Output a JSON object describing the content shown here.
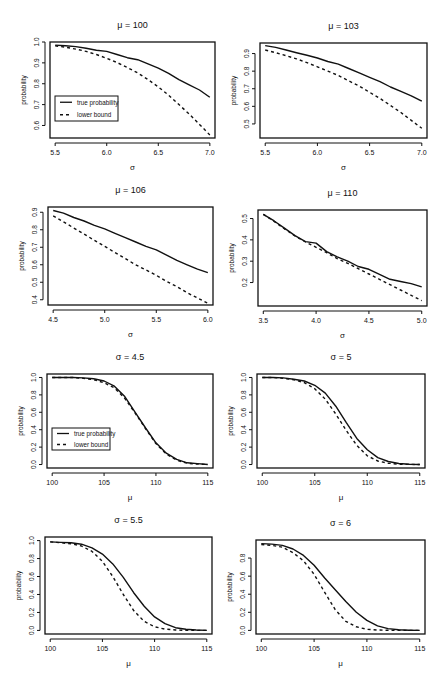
{
  "chart_data": [
    {
      "type": "line",
      "title": "μ = 100",
      "xlabel": "σ",
      "ylabel": "probability",
      "box": [
        50,
        42,
        215,
        138
      ],
      "xlim": [
        5.45,
        7.05
      ],
      "ylim": [
        0.54,
        1.0
      ],
      "xticks": [
        5.5,
        6.0,
        6.5,
        7.0
      ],
      "xtick_labels": [
        "5.5",
        "6.0",
        "6.5",
        "7.0"
      ],
      "yticks": [
        0.6,
        0.7,
        0.8,
        0.9,
        1.0
      ],
      "ytick_labels": [
        "0.6",
        "0.7",
        "0.8",
        "0.9",
        "1.0"
      ],
      "legend": {
        "entries": [
          "true probability",
          "lower bound"
        ],
        "box": [
          55,
          96,
          118,
          121
        ]
      },
      "series": [
        {
          "name": "true probability",
          "style": "solid",
          "x": [
            5.5,
            5.6,
            5.7,
            5.8,
            5.9,
            6.0,
            6.1,
            6.2,
            6.3,
            6.4,
            6.5,
            6.6,
            6.7,
            6.8,
            6.9,
            7.0
          ],
          "y": [
            0.985,
            0.982,
            0.978,
            0.97,
            0.96,
            0.955,
            0.94,
            0.925,
            0.915,
            0.895,
            0.875,
            0.85,
            0.82,
            0.795,
            0.77,
            0.735
          ]
        },
        {
          "name": "lower bound",
          "style": "dashed",
          "x": [
            5.5,
            5.6,
            5.7,
            5.8,
            5.9,
            6.0,
            6.1,
            6.2,
            6.3,
            6.4,
            6.5,
            6.6,
            6.7,
            6.8,
            6.9,
            7.0
          ],
          "y": [
            0.982,
            0.975,
            0.966,
            0.955,
            0.94,
            0.922,
            0.902,
            0.878,
            0.852,
            0.82,
            0.785,
            0.745,
            0.7,
            0.655,
            0.605,
            0.555
          ]
        }
      ]
    },
    {
      "type": "line",
      "title": "μ = 103",
      "xlabel": "σ",
      "ylabel": "probability",
      "box": [
        260,
        43,
        427,
        138
      ],
      "xlim": [
        5.45,
        7.05
      ],
      "ylim": [
        0.42,
        0.96
      ],
      "xticks": [
        5.5,
        6.0,
        6.5,
        7.0
      ],
      "xtick_labels": [
        "5.5",
        "6.0",
        "6.5",
        "7.0"
      ],
      "yticks": [
        0.5,
        0.6,
        0.7,
        0.8,
        0.9
      ],
      "ytick_labels": [
        "0.5",
        "0.6",
        "0.7",
        "0.8",
        "0.9"
      ],
      "series": [
        {
          "name": "true probability",
          "style": "solid",
          "x": [
            5.5,
            5.6,
            5.7,
            5.8,
            5.9,
            6.0,
            6.1,
            6.2,
            6.3,
            6.4,
            6.5,
            6.6,
            6.7,
            6.8,
            6.9,
            7.0
          ],
          "y": [
            0.945,
            0.935,
            0.92,
            0.905,
            0.89,
            0.875,
            0.855,
            0.84,
            0.815,
            0.79,
            0.765,
            0.74,
            0.71,
            0.685,
            0.66,
            0.63
          ]
        },
        {
          "name": "lower bound",
          "style": "dashed",
          "x": [
            5.5,
            5.6,
            5.7,
            5.8,
            5.9,
            6.0,
            6.1,
            6.2,
            6.3,
            6.4,
            6.5,
            6.6,
            6.7,
            6.8,
            6.9,
            7.0
          ],
          "y": [
            0.92,
            0.905,
            0.888,
            0.87,
            0.848,
            0.825,
            0.8,
            0.775,
            0.745,
            0.715,
            0.68,
            0.645,
            0.605,
            0.565,
            0.52,
            0.475
          ]
        }
      ]
    },
    {
      "type": "line",
      "title": "μ = 106",
      "xlabel": "σ",
      "ylabel": "probability",
      "box": [
        48,
        207,
        213,
        305
      ],
      "xlim": [
        4.45,
        6.05
      ],
      "ylim": [
        0.37,
        0.93
      ],
      "xticks": [
        4.5,
        5.0,
        5.5,
        6.0
      ],
      "xtick_labels": [
        "4.5",
        "5.0",
        "5.5",
        "6.0"
      ],
      "yticks": [
        0.4,
        0.5,
        0.6,
        0.7,
        0.8,
        0.9
      ],
      "ytick_labels": [
        "0.4",
        "0.5",
        "0.6",
        "0.7",
        "0.8",
        "0.9"
      ],
      "series": [
        {
          "name": "true probability",
          "style": "solid",
          "x": [
            4.5,
            4.6,
            4.7,
            4.8,
            4.9,
            5.0,
            5.1,
            5.2,
            5.3,
            5.4,
            5.5,
            5.6,
            5.7,
            5.8,
            5.9,
            6.0
          ],
          "y": [
            0.91,
            0.895,
            0.87,
            0.85,
            0.825,
            0.805,
            0.78,
            0.755,
            0.73,
            0.705,
            0.685,
            0.655,
            0.625,
            0.6,
            0.575,
            0.555
          ]
        },
        {
          "name": "lower bound",
          "style": "dashed",
          "x": [
            4.5,
            4.6,
            4.7,
            4.8,
            4.9,
            5.0,
            5.1,
            5.2,
            5.3,
            5.4,
            5.5,
            5.6,
            5.7,
            5.8,
            5.9,
            6.0
          ],
          "y": [
            0.88,
            0.845,
            0.81,
            0.775,
            0.74,
            0.705,
            0.67,
            0.635,
            0.6,
            0.57,
            0.54,
            0.505,
            0.475,
            0.44,
            0.41,
            0.38
          ]
        }
      ]
    },
    {
      "type": "line",
      "title": "μ = 110",
      "xlabel": "σ",
      "ylabel": "probability",
      "box": [
        258,
        210,
        427,
        306
      ],
      "xlim": [
        3.45,
        5.05
      ],
      "ylim": [
        0.09,
        0.54
      ],
      "xticks": [
        3.5,
        4.0,
        4.5,
        5.0
      ],
      "xtick_labels": [
        "3.5",
        "4.0",
        "4.5",
        "5.0"
      ],
      "yticks": [
        0.2,
        0.3,
        0.4,
        0.5
      ],
      "ytick_labels": [
        "0.2",
        "0.3",
        "0.4",
        "0.5"
      ],
      "series": [
        {
          "name": "true probability",
          "style": "solid",
          "x": [
            3.5,
            3.6,
            3.7,
            3.8,
            3.9,
            4.0,
            4.1,
            4.2,
            4.3,
            4.4,
            4.5,
            4.6,
            4.7,
            4.8,
            4.9,
            5.0
          ],
          "y": [
            0.52,
            0.49,
            0.455,
            0.42,
            0.392,
            0.385,
            0.345,
            0.32,
            0.3,
            0.275,
            0.262,
            0.238,
            0.215,
            0.205,
            0.195,
            0.18
          ]
        },
        {
          "name": "lower bound",
          "style": "dashed",
          "x": [
            3.5,
            3.6,
            3.7,
            3.8,
            3.9,
            4.0,
            4.1,
            4.2,
            4.3,
            4.4,
            4.5,
            4.6,
            4.7,
            4.8,
            4.9,
            5.0
          ],
          "y": [
            0.52,
            0.488,
            0.452,
            0.418,
            0.39,
            0.365,
            0.34,
            0.312,
            0.29,
            0.265,
            0.24,
            0.215,
            0.19,
            0.165,
            0.14,
            0.115
          ]
        }
      ]
    },
    {
      "type": "line",
      "title": "σ = 4.5",
      "xlabel": "μ",
      "ylabel": "probability",
      "box": [
        47,
        374,
        213,
        468
      ],
      "xlim": [
        99.5,
        115.5
      ],
      "ylim": [
        -0.04,
        1.04
      ],
      "xticks": [
        100,
        105,
        110,
        115
      ],
      "xtick_labels": [
        "100",
        "105",
        "110",
        "115"
      ],
      "yticks": [
        0.0,
        0.2,
        0.4,
        0.6,
        0.8,
        1.0
      ],
      "ytick_labels": [
        "0.0",
        "0.2",
        "0.4",
        "0.6",
        "0.8",
        "1.0"
      ],
      "legend": {
        "entries": [
          "true probability",
          "lower bound"
        ],
        "box": [
          52,
          428,
          110,
          450
        ]
      },
      "series": [
        {
          "name": "true probability",
          "style": "solid",
          "x": [
            100,
            101,
            102,
            103,
            104,
            105,
            106,
            107,
            108,
            109,
            110,
            111,
            112,
            113,
            114,
            115
          ],
          "y": [
            1.0,
            1.0,
            1.0,
            0.995,
            0.985,
            0.96,
            0.9,
            0.78,
            0.6,
            0.42,
            0.25,
            0.13,
            0.06,
            0.02,
            0.01,
            0.0
          ]
        },
        {
          "name": "lower bound",
          "style": "dashed",
          "x": [
            100,
            101,
            102,
            103,
            104,
            105,
            106,
            107,
            108,
            109,
            110,
            111,
            112,
            113,
            114,
            115
          ],
          "y": [
            1.0,
            1.0,
            1.0,
            0.99,
            0.975,
            0.94,
            0.88,
            0.76,
            0.59,
            0.41,
            0.24,
            0.12,
            0.05,
            0.015,
            0.005,
            0.0
          ]
        }
      ]
    },
    {
      "type": "line",
      "title": "σ = 5",
      "xlabel": "μ",
      "ylabel": "probability",
      "box": [
        257,
        374,
        425,
        468
      ],
      "xlim": [
        99.5,
        115.5
      ],
      "ylim": [
        -0.04,
        1.04
      ],
      "xticks": [
        100,
        105,
        110,
        115
      ],
      "xtick_labels": [
        "100",
        "105",
        "110",
        "115"
      ],
      "yticks": [
        0.0,
        0.2,
        0.4,
        0.6,
        0.8,
        1.0
      ],
      "ytick_labels": [
        "0.0",
        "0.2",
        "0.4",
        "0.6",
        "0.8",
        "1.0"
      ],
      "series": [
        {
          "name": "true probability",
          "style": "solid",
          "x": [
            100,
            101,
            102,
            103,
            104,
            105,
            106,
            107,
            108,
            109,
            110,
            111,
            112,
            113,
            114,
            115
          ],
          "y": [
            1.0,
            1.0,
            0.995,
            0.98,
            0.96,
            0.91,
            0.82,
            0.67,
            0.48,
            0.3,
            0.17,
            0.08,
            0.035,
            0.012,
            0.004,
            0.0
          ]
        },
        {
          "name": "lower bound",
          "style": "dashed",
          "x": [
            100,
            101,
            102,
            103,
            104,
            105,
            106,
            107,
            108,
            109,
            110,
            111,
            112,
            113,
            114,
            115
          ],
          "y": [
            1.0,
            1.0,
            0.99,
            0.975,
            0.94,
            0.87,
            0.75,
            0.58,
            0.39,
            0.22,
            0.1,
            0.04,
            0.015,
            0.004,
            0.001,
            0.0
          ]
        }
      ]
    },
    {
      "type": "line",
      "title": "σ = 5.5",
      "xlabel": "μ",
      "ylabel": "probability",
      "box": [
        45,
        537,
        212,
        634
      ],
      "xlim": [
        99.5,
        115.5
      ],
      "ylim": [
        -0.04,
        1.04
      ],
      "xticks": [
        100,
        105,
        110,
        115
      ],
      "xtick_labels": [
        "100",
        "105",
        "110",
        "115"
      ],
      "yticks": [
        0.0,
        0.2,
        0.4,
        0.6,
        0.8,
        1.0
      ],
      "ytick_labels": [
        "0.0",
        "0.2",
        "0.4",
        "0.6",
        "0.8",
        "1.0"
      ],
      "series": [
        {
          "name": "true probability",
          "style": "solid",
          "x": [
            100,
            101,
            102,
            103,
            104,
            105,
            106,
            107,
            108,
            109,
            110,
            111,
            112,
            113,
            114,
            115
          ],
          "y": [
            0.985,
            0.98,
            0.975,
            0.96,
            0.92,
            0.85,
            0.74,
            0.59,
            0.42,
            0.27,
            0.15,
            0.075,
            0.03,
            0.012,
            0.004,
            0.0
          ]
        },
        {
          "name": "lower bound",
          "style": "dashed",
          "x": [
            100,
            101,
            102,
            103,
            104,
            105,
            106,
            107,
            108,
            109,
            110,
            111,
            112,
            113,
            114,
            115
          ],
          "y": [
            0.985,
            0.975,
            0.965,
            0.94,
            0.88,
            0.77,
            0.6,
            0.4,
            0.22,
            0.1,
            0.04,
            0.015,
            0.005,
            0.001,
            0.0,
            0.0
          ]
        }
      ]
    },
    {
      "type": "line",
      "title": "σ = 6",
      "xlabel": "μ",
      "ylabel": "probability",
      "box": [
        256,
        540,
        425,
        634
      ],
      "xlim": [
        99.5,
        115.5
      ],
      "ylim": [
        -0.04,
        1.0
      ],
      "xticks": [
        100,
        105,
        110,
        115
      ],
      "xtick_labels": [
        "100",
        "105",
        "110",
        "115"
      ],
      "yticks": [
        0.0,
        0.2,
        0.4,
        0.6,
        0.8
      ],
      "ytick_labels": [
        "0.0",
        "0.2",
        "0.4",
        "0.6",
        "0.8"
      ],
      "series": [
        {
          "name": "true probability",
          "style": "solid",
          "x": [
            100,
            101,
            102,
            103,
            104,
            105,
            106,
            107,
            108,
            109,
            110,
            111,
            112,
            113,
            114,
            115
          ],
          "y": [
            0.96,
            0.955,
            0.94,
            0.9,
            0.83,
            0.72,
            0.58,
            0.45,
            0.32,
            0.2,
            0.11,
            0.05,
            0.02,
            0.007,
            0.002,
            0.0
          ]
        },
        {
          "name": "lower bound",
          "style": "dashed",
          "x": [
            100,
            101,
            102,
            103,
            104,
            105,
            106,
            107,
            108,
            109,
            110,
            111,
            112,
            113,
            114,
            115
          ],
          "y": [
            0.95,
            0.94,
            0.92,
            0.86,
            0.77,
            0.62,
            0.42,
            0.23,
            0.1,
            0.04,
            0.012,
            0.004,
            0.001,
            0.0,
            0.0,
            0.0
          ]
        }
      ]
    }
  ]
}
